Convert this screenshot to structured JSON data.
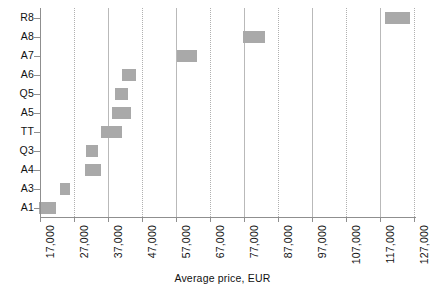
{
  "chart_data": {
    "type": "bar",
    "orientation": "horizontal",
    "title": "",
    "xlabel": "Average price, EUR",
    "ylabel": "",
    "categories": [
      "A1",
      "A3",
      "A4",
      "Q3",
      "TT",
      "A5",
      "Q5",
      "A6",
      "A7",
      "A8",
      "R8"
    ],
    "xticklabels": [
      "17,000",
      "27,000",
      "37,000",
      "47,000",
      "57,000",
      "67,000",
      "77,000",
      "87,000",
      "97,000",
      "107,000",
      "117,000",
      "127,000"
    ],
    "xtickvalues": [
      17000,
      27000,
      37000,
      47000,
      57000,
      67000,
      77000,
      87000,
      97000,
      107000,
      117000,
      127000
    ],
    "xlim": [
      17000,
      127000
    ],
    "grid": "vertical",
    "legend": "none",
    "series": [
      {
        "name": "Average price range",
        "type": "range-bar",
        "values": [
          {
            "category": "A1",
            "low": 16600,
            "high": 21700,
            "center": 19150
          },
          {
            "category": "A3",
            "low": 22900,
            "high": 25900,
            "center": 24400
          },
          {
            "category": "A4",
            "low": 30200,
            "high": 34900,
            "center": 32550
          },
          {
            "category": "Q3",
            "low": 30500,
            "high": 34000,
            "center": 32250
          },
          {
            "category": "TT",
            "low": 34900,
            "high": 41100,
            "center": 38000
          },
          {
            "category": "A5",
            "low": 38200,
            "high": 43800,
            "center": 41000
          },
          {
            "category": "Q5",
            "low": 39100,
            "high": 42900,
            "center": 41000
          },
          {
            "category": "A6",
            "low": 41100,
            "high": 45200,
            "center": 43150
          },
          {
            "category": "A7",
            "low": 57300,
            "high": 63200,
            "center": 60250
          },
          {
            "category": "A8",
            "low": 76700,
            "high": 83200,
            "center": 79950
          },
          {
            "category": "R8",
            "low": 118500,
            "high": 125900,
            "center": 122200
          }
        ]
      }
    ],
    "marker_color": "#a9a9a9",
    "gridline_color": "#b9b9b9",
    "axis_color": "#8f8f8f"
  },
  "axis": {
    "x_title": "Average price, EUR"
  },
  "caption": {
    "text": ""
  }
}
